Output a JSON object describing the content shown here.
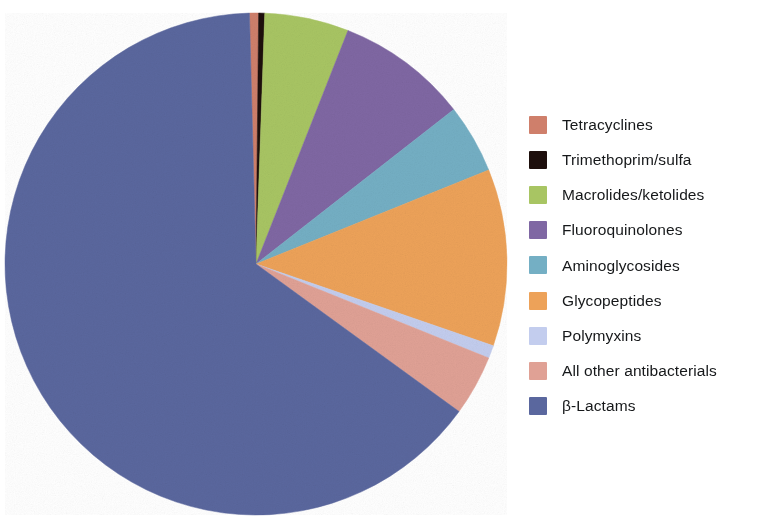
{
  "chart_data": {
    "type": "pie",
    "title": "",
    "subtitle": "",
    "xlabel": "",
    "ylabel": "",
    "grid": false,
    "legend_position": "right",
    "start_angle_deg": 358.5,
    "direction": "clockwise",
    "center": {
      "x": 256,
      "y": 264
    },
    "radius": 251,
    "categories": [
      "Tetracyclines",
      "Trimethoprim/sulfa",
      "Macrolides/ketolides",
      "Fluoroquinolones",
      "Aminoglycosides",
      "Glycopeptides",
      "Polymyxins",
      "All other antibacterials",
      "β-Lactams"
    ],
    "values": [
      0.6,
      0.4,
      5.4,
      8.5,
      4.4,
      11.4,
      0.8,
      3.9,
      64.6
    ],
    "colors": [
      "#cf7f6b",
      "#1d0f0c",
      "#a8c563",
      "#7f67a3",
      "#74afc4",
      "#eda259",
      "#c3cdee",
      "#e0a195",
      "#5a679e"
    ],
    "slices": [
      {
        "label": "Tetracyclines",
        "value": 0.6,
        "color": "#cf7f6b",
        "start_deg": 358.5,
        "end_deg": 360.6
      },
      {
        "label": "Trimethoprim/sulfa",
        "value": 0.4,
        "color": "#1d0f0c",
        "start_deg": 360.6,
        "end_deg": 362.0
      },
      {
        "label": "Macrolides/ketolides",
        "value": 5.4,
        "color": "#a8c563",
        "start_deg": 362.0,
        "end_deg": 381.5
      },
      {
        "label": "Fluoroquinolones",
        "value": 8.5,
        "color": "#7f67a3",
        "start_deg": 381.5,
        "end_deg": 412.0
      },
      {
        "label": "Aminoglycosides",
        "value": 4.4,
        "color": "#74afc4",
        "start_deg": 412.0,
        "end_deg": 428.0
      },
      {
        "label": "Glycopeptides",
        "value": 11.4,
        "color": "#eda259",
        "start_deg": 428.0,
        "end_deg": 469.0
      },
      {
        "label": "Polymyxins",
        "value": 0.8,
        "color": "#c3cdee",
        "start_deg": 469.0,
        "end_deg": 472.0
      },
      {
        "label": "All other antibacterials",
        "value": 3.9,
        "color": "#e0a195",
        "start_deg": 472.0,
        "end_deg": 486.0
      },
      {
        "label": "β-Lactams",
        "value": 64.6,
        "color": "#5a679e",
        "start_deg": 486.0,
        "end_deg": 718.5
      }
    ]
  },
  "legend": {
    "items": [
      {
        "label": "Tetracyclines",
        "color": "#cf7f6b"
      },
      {
        "label": "Trimethoprim/sulfa",
        "color": "#1d0f0c"
      },
      {
        "label": "Macrolides/ketolides",
        "color": "#a8c563"
      },
      {
        "label": "Fluoroquinolones",
        "color": "#7f67a3"
      },
      {
        "label": "Aminoglycosides",
        "color": "#74afc4"
      },
      {
        "label": "Glycopeptides",
        "color": "#eda259"
      },
      {
        "label": "Polymyxins",
        "color": "#c3cdee"
      },
      {
        "label": "All other antibacterials",
        "color": "#e0a195"
      },
      {
        "label": "β-Lactams",
        "color": "#5a679e"
      }
    ]
  }
}
